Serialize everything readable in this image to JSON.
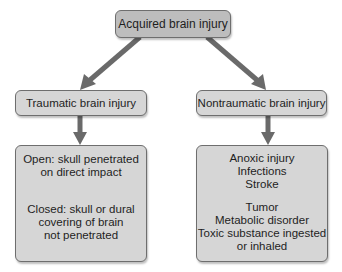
{
  "diagram": {
    "root": {
      "label": "Acquired brain injury"
    },
    "branches": [
      {
        "label": "Traumatic brain injury",
        "detail_groups": [
          [
            "Open: skull penetrated",
            "on direct impact"
          ],
          [
            "Closed: skull or dural",
            "covering of brain",
            "not penetrated"
          ]
        ]
      },
      {
        "label": "Nontraumatic brain injury",
        "detail_groups": [
          [
            "Anoxic injury",
            "Infections",
            "Stroke"
          ],
          [
            "Tumor",
            "Metabolic disorder",
            "Toxic substance ingested",
            "or inhaled"
          ]
        ]
      }
    ],
    "colors": {
      "root_fill": "#bdbdbd",
      "node_fill": "#d6d6d6",
      "border": "#6e6e6e",
      "arrow": "#6a6a6a",
      "background": "#ffffff"
    },
    "edges": [
      {
        "from": "Acquired brain injury",
        "to": "Traumatic brain injury"
      },
      {
        "from": "Acquired brain injury",
        "to": "Nontraumatic brain injury"
      },
      {
        "from": "Traumatic brain injury",
        "to": "Open/Closed details"
      },
      {
        "from": "Nontraumatic brain injury",
        "to": "Nontraumatic causes"
      }
    ]
  }
}
